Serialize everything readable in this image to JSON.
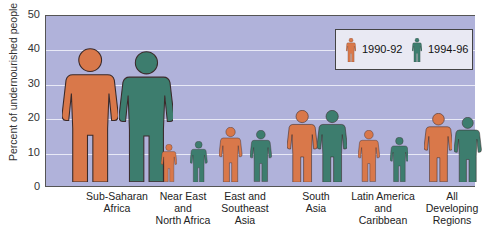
{
  "chart_data": {
    "type": "bar",
    "style": "pictograph (human figures, height = value)",
    "title": "",
    "xlabel": "",
    "ylabel": "Percent of undernourished people",
    "ylim": [
      0,
      50
    ],
    "yticks": [
      "0",
      "10",
      "20",
      "30",
      "40",
      "50"
    ],
    "grid": true,
    "legend_position": "upper right",
    "categories": [
      "Sub-Saharan\nAfrica",
      "Near East\nand\nNorth Africa",
      "East and\nSoutheast\nAsia",
      "South\nAsia",
      "Latin America\nand\nCaribbean",
      "All\nDeveloping\nRegions"
    ],
    "series": [
      {
        "name": "1990-92",
        "color": "#d9784a",
        "values": [
          39,
          11,
          16,
          21,
          15,
          20
        ]
      },
      {
        "name": "1994-96",
        "color": "#3d7d6e",
        "values": [
          38,
          12,
          15,
          21,
          13,
          19
        ]
      }
    ]
  },
  "colors": {
    "plot_bg": "#b0b2da",
    "grid": "#e8e9f6",
    "orange": "#d9784a",
    "teal": "#3d7d6e",
    "outline": "#3a2a2a"
  }
}
